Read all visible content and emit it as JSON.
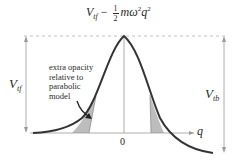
{
  "diagram": {
    "title_formula": {
      "V": "V",
      "V_sub": "tf",
      "minus": " − ",
      "frac_num": "1",
      "frac_den": "2",
      "m_omega": "mω",
      "omega_sub": "t",
      "omega_sup": "2",
      "q": "q",
      "q_sup": "2"
    },
    "left_arrow_label": {
      "V": "V",
      "sub": "tf"
    },
    "right_arrow_label": {
      "V": "V",
      "sub": "tb"
    },
    "annotation": [
      "extra opacity",
      "relative to",
      "parabolic",
      "model"
    ],
    "x_axis_label": "q",
    "origin_label": "0",
    "colors": {
      "curve": "#333333",
      "shade": "#bfbfbf",
      "axis": "#9a9a9a",
      "text": "#2a2a2a"
    }
  }
}
